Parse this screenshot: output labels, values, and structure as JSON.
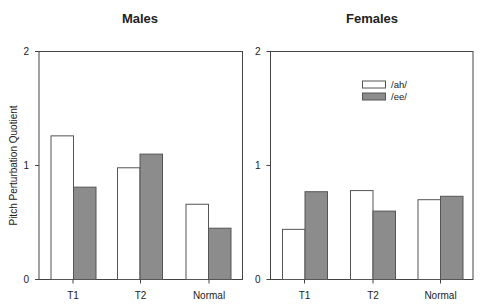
{
  "chart_data": [
    {
      "type": "bar",
      "title": "Males",
      "xlabel": "",
      "ylabel": "Pitch Perturbation Quotient",
      "ylim": [
        0,
        2
      ],
      "yticks": [
        0,
        1,
        2
      ],
      "categories": [
        "T1",
        "T2",
        "Normal"
      ],
      "series": [
        {
          "name": "/ah/",
          "color": "#ffffff",
          "values": [
            1.26,
            0.98,
            0.66
          ]
        },
        {
          "name": "/ee/",
          "color": "#8c8c8c",
          "values": [
            0.81,
            1.1,
            0.45
          ]
        }
      ],
      "grid": false,
      "legend": null
    },
    {
      "type": "bar",
      "title": "Females",
      "xlabel": "",
      "ylabel": "",
      "ylim": [
        0,
        2
      ],
      "yticks": [
        0,
        1,
        2
      ],
      "categories": [
        "T1",
        "T2",
        "Normal"
      ],
      "series": [
        {
          "name": "/ah/",
          "color": "#ffffff",
          "values": [
            0.44,
            0.78,
            0.7
          ]
        },
        {
          "name": "/ee/",
          "color": "#8c8c8c",
          "values": [
            0.77,
            0.6,
            0.73
          ]
        }
      ],
      "grid": false,
      "legend": {
        "position": "upper-center-right",
        "entries": [
          "/ah/",
          "/ee/"
        ]
      }
    }
  ],
  "colors": {
    "axis": "#444444",
    "bar_outline": "#555555",
    "ah_fill": "#ffffff",
    "ee_fill": "#8c8c8c"
  }
}
